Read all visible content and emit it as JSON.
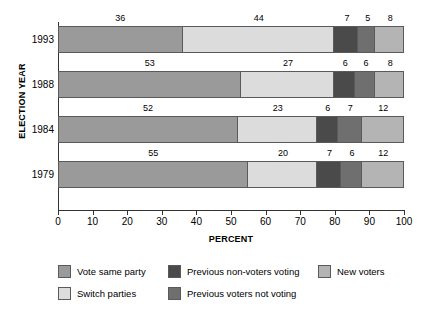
{
  "chart_data": {
    "type": "bar",
    "orientation": "horizontal",
    "stacked": true,
    "stack_mode": "percent",
    "title": "",
    "xlabel": "PERCENT",
    "ylabel": "ELECTION YEAR",
    "xlim": [
      0,
      100
    ],
    "xticks": [
      0,
      10,
      20,
      30,
      40,
      50,
      60,
      70,
      80,
      90,
      100
    ],
    "xticklabels": [
      "0",
      "10",
      "20",
      "30",
      "40",
      "50",
      "60",
      "70",
      "80",
      "90",
      "100"
    ],
    "grid": false,
    "legend_position": "bottom",
    "categories": [
      "1993",
      "1988",
      "1984",
      "1979"
    ],
    "series": [
      {
        "name": "Vote same party",
        "color": "#9a9a9a",
        "values": [
          36,
          53,
          52,
          55
        ]
      },
      {
        "name": "Switch parties",
        "color": "#dcdcdc",
        "values": [
          44,
          27,
          23,
          20
        ]
      },
      {
        "name": "Previous non-voters voting",
        "color": "#4a4a4a",
        "values": [
          7,
          6,
          6,
          7
        ]
      },
      {
        "name": "Previous voters not voting",
        "color": "#6f6f6f",
        "values": [
          5,
          6,
          7,
          6
        ]
      },
      {
        "name": "New voters",
        "color": "#b4b4b4",
        "values": [
          8,
          8,
          12,
          12
        ]
      }
    ],
    "rows": [
      {
        "category": "1993",
        "segments": [
          {
            "label": "Vote same party",
            "value": 36,
            "display": "36"
          },
          {
            "label": "Switch parties",
            "value": 44,
            "display": "44"
          },
          {
            "label": "Previous non-voters voting",
            "value": 7,
            "display": "7"
          },
          {
            "label": "Previous voters not voting",
            "value": 5,
            "display": "5"
          },
          {
            "label": "New voters",
            "value": 8,
            "display": "8"
          }
        ]
      },
      {
        "category": "1988",
        "segments": [
          {
            "label": "Vote same party",
            "value": 53,
            "display": "53"
          },
          {
            "label": "Switch parties",
            "value": 27,
            "display": "27"
          },
          {
            "label": "Previous non-voters voting",
            "value": 6,
            "display": "6"
          },
          {
            "label": "Previous voters not voting",
            "value": 6,
            "display": "6"
          },
          {
            "label": "New voters",
            "value": 8,
            "display": "8"
          }
        ]
      },
      {
        "category": "1984",
        "segments": [
          {
            "label": "Vote same party",
            "value": 52,
            "display": "52"
          },
          {
            "label": "Switch parties",
            "value": 23,
            "display": "23"
          },
          {
            "label": "Previous non-voters voting",
            "value": 6,
            "display": "6"
          },
          {
            "label": "Previous voters not voting",
            "value": 7,
            "display": "7"
          },
          {
            "label": "New voters",
            "value": 12,
            "display": "12"
          }
        ]
      },
      {
        "category": "1979",
        "segments": [
          {
            "label": "Vote same party",
            "value": 55,
            "display": "55"
          },
          {
            "label": "Switch parties",
            "value": 20,
            "display": "20"
          },
          {
            "label": "Previous non-voters voting",
            "value": 7,
            "display": "7"
          },
          {
            "label": "Previous voters not voting",
            "value": 6,
            "display": "6"
          },
          {
            "label": "New voters",
            "value": 12,
            "display": "12"
          }
        ]
      }
    ],
    "legend_columns": [
      [
        {
          "label": "Vote same party",
          "color": "#9a9a9a"
        },
        {
          "label": "Switch parties",
          "color": "#dcdcdc"
        }
      ],
      [
        {
          "label": "Previous non-voters voting",
          "color": "#4a4a4a"
        },
        {
          "label": "Previous voters not voting",
          "color": "#6f6f6f"
        }
      ],
      [
        {
          "label": "New voters",
          "color": "#b4b4b4"
        }
      ]
    ],
    "colors": {
      "axis": "#333333",
      "segment_border": "#5a5a5a",
      "text": "#000000",
      "background": "#ffffff"
    }
  }
}
